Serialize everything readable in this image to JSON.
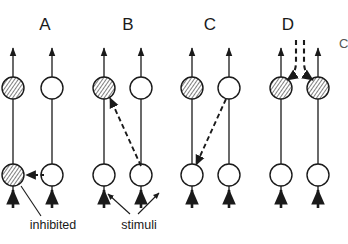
{
  "figure": {
    "background_color": "#ffffff",
    "line_color": "#1a1a1a",
    "hatch_color": "#3a3a3a",
    "open_fill": "#ffffff",
    "width": 348,
    "height": 244
  },
  "panels": [
    {
      "id": "A",
      "letter": "A",
      "letter_x": 45,
      "letter_y": 30,
      "axons": [
        {
          "x": 13,
          "top_circle": "hatched",
          "bottom_circle": "hatched",
          "top_arrow": true,
          "stimulus_arrow": true
        },
        {
          "x": 52,
          "top_circle": "open",
          "bottom_circle": "open",
          "top_arrow": true,
          "stimulus_arrow": true
        }
      ],
      "dashed_arrows": [
        {
          "kind": "horizontal-inhibition",
          "x1": 44,
          "y1": 175,
          "x2": 22,
          "y2": 175
        }
      ]
    },
    {
      "id": "B",
      "letter": "B",
      "letter_x": 128,
      "letter_y": 30,
      "axons": [
        {
          "x": 104,
          "top_circle": "hatched",
          "bottom_circle": "open",
          "top_arrow": true,
          "stimulus_arrow": true
        },
        {
          "x": 141,
          "top_circle": "open",
          "bottom_circle": "open",
          "top_arrow": true,
          "stimulus_arrow": true
        }
      ],
      "dashed_arrows": [
        {
          "kind": "diagonal-up-left",
          "x1": 140,
          "y1": 168,
          "x2": 110,
          "y2": 97
        }
      ]
    },
    {
      "id": "C",
      "letter": "C",
      "letter_x": 210,
      "letter_y": 30,
      "axons": [
        {
          "x": 192,
          "top_circle": "hatched",
          "bottom_circle": "open",
          "top_arrow": true,
          "stimulus_arrow": true
        },
        {
          "x": 229,
          "top_circle": "open",
          "bottom_circle": "open",
          "top_arrow": true,
          "stimulus_arrow": true
        }
      ],
      "dashed_arrows": [
        {
          "kind": "diagonal-down-left",
          "x1": 226,
          "y1": 99,
          "x2": 196,
          "y2": 167
        }
      ]
    },
    {
      "id": "D",
      "letter": "D",
      "letter_x": 288,
      "letter_y": 30,
      "axons": [
        {
          "x": 281,
          "top_circle": "hatched",
          "bottom_circle": "open",
          "top_arrow": true,
          "stimulus_arrow": true
        },
        {
          "x": 318,
          "top_circle": "hatched",
          "bottom_circle": "open",
          "top_arrow": true,
          "stimulus_arrow": true
        }
      ],
      "dashed_arrows": [
        {
          "kind": "descending-curve",
          "x1": 296,
          "y1": 40,
          "x2": 287,
          "y2": 81
        },
        {
          "kind": "descending-curve",
          "x1": 311,
          "y1": 40,
          "x2": 322,
          "y2": 81
        }
      ]
    }
  ],
  "annotations": [
    {
      "name": "inhibited",
      "text": "inhibited",
      "text_x": 53,
      "text_y": 228,
      "leader_from_x": 41,
      "leader_from_y": 216,
      "leader_to_x": 20,
      "leader_to_y": 185
    },
    {
      "name": "stimuli",
      "text": "stimuli",
      "text_x": 139,
      "text_y": 228,
      "leaders": [
        {
          "from_x": 128,
          "from_y": 215,
          "to_x": 107,
          "to_y": 194
        },
        {
          "from_x": 140,
          "from_y": 215,
          "to_x": 160,
          "to_y": 192
        }
      ]
    }
  ],
  "edge_fragment": {
    "name": "cropped-glyph-right-edge",
    "text": "C",
    "x": 339,
    "y": 48
  },
  "geometry": {
    "top_arrow_tip_y": 44,
    "top_circle_cy": 88,
    "circle_r": 11,
    "bottom_circle_cy": 175,
    "stimulus_arrow_base_y": 208,
    "axon_bottom_y": 196,
    "axon_top_y": 48
  }
}
